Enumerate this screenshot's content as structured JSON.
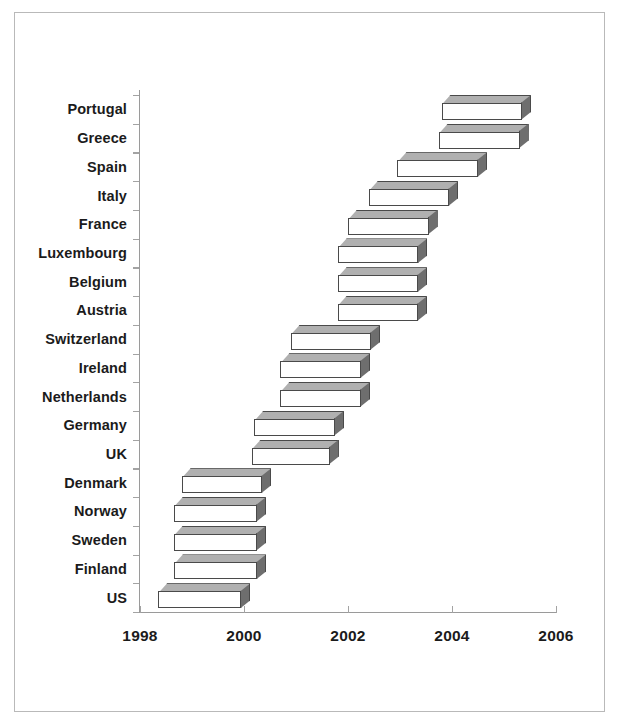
{
  "chart_data": {
    "type": "bar",
    "orientation": "horizontal",
    "subtype": "gantt-range-bar-3d",
    "title": "",
    "subtitle": "",
    "xlabel": "",
    "ylabel": "",
    "xlim": [
      1998,
      2006
    ],
    "xticks": [
      1998,
      2000,
      2002,
      2004,
      2006
    ],
    "xticklabels": [
      "1998",
      "2000",
      "2002",
      "2004",
      "2006"
    ],
    "grid": false,
    "legend": null,
    "categories": [
      "Portugal",
      "Greece",
      "Spain",
      "Italy",
      "France",
      "Luxembourg",
      "Belgium",
      "Austria",
      "Switzerland",
      "Ireland",
      "Netherlands",
      "Germany",
      "UK",
      "Denmark",
      "Norway",
      "Sweden",
      "Finland",
      "US"
    ],
    "series": [
      {
        "name": "period",
        "ranges": [
          {
            "category": "Portugal",
            "start": 2003.8,
            "end": 2005.35
          },
          {
            "category": "Greece",
            "start": 2003.75,
            "end": 2005.3
          },
          {
            "category": "Spain",
            "start": 2002.95,
            "end": 2004.5
          },
          {
            "category": "Italy",
            "start": 2002.4,
            "end": 2003.95
          },
          {
            "category": "France",
            "start": 2002.0,
            "end": 2003.55
          },
          {
            "category": "Luxembourg",
            "start": 2001.8,
            "end": 2003.35
          },
          {
            "category": "Belgium",
            "start": 2001.8,
            "end": 2003.35
          },
          {
            "category": "Austria",
            "start": 2001.8,
            "end": 2003.35
          },
          {
            "category": "Switzerland",
            "start": 2000.9,
            "end": 2002.45
          },
          {
            "category": "Ireland",
            "start": 2000.7,
            "end": 2002.25
          },
          {
            "category": "Netherlands",
            "start": 2000.7,
            "end": 2002.25
          },
          {
            "category": "Germany",
            "start": 2000.2,
            "end": 2001.75
          },
          {
            "category": "UK",
            "start": 2000.15,
            "end": 2001.65
          },
          {
            "category": "Denmark",
            "start": 1998.8,
            "end": 2000.35
          },
          {
            "category": "Norway",
            "start": 1998.65,
            "end": 2000.25
          },
          {
            "category": "Sweden",
            "start": 1998.65,
            "end": 2000.25
          },
          {
            "category": "Finland",
            "start": 1998.65,
            "end": 2000.25
          },
          {
            "category": "US",
            "start": 1998.35,
            "end": 1999.95
          }
        ]
      }
    ]
  },
  "axis": {
    "x_tick_labels": [
      "1998",
      "2000",
      "2002",
      "2004",
      "2006"
    ],
    "y_tick_labels": [
      "Portugal",
      "Greece",
      "Spain",
      "Italy",
      "France",
      "Luxembourg",
      "Belgium",
      "Austria",
      "Switzerland",
      "Ireland",
      "Netherlands",
      "Germany",
      "UK",
      "Denmark",
      "Norway",
      "Sweden",
      "Finland",
      "US"
    ]
  },
  "colors": {
    "bar_front": "#ffffff",
    "bar_top": "#b0b0b0",
    "bar_side": "#6e6e6e",
    "bar_outline": "#4a4a4a",
    "axis": "#9a9a9a",
    "text": "#1b1b1b",
    "frame": "#b9b9b9",
    "background": "#ffffff"
  }
}
